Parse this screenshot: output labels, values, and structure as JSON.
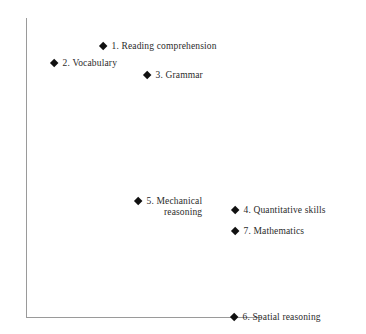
{
  "chart_data": {
    "type": "scatter",
    "title": "",
    "xlabel": "",
    "ylabel": "",
    "grid": false,
    "legend_position": "none",
    "axes": {
      "origin_px": [
        26,
        317
      ],
      "x_axis_end_px": [
        262,
        317
      ],
      "y_axis_top_px": [
        26,
        18
      ],
      "color": "#9a9a9a",
      "ticks": []
    },
    "marker": {
      "shape": "diamond",
      "color": "#111111",
      "size_px": 9
    },
    "points": [
      {
        "id": 1,
        "number": "1.",
        "label": "Reading comprehension",
        "x_px": 103,
        "y_px": 46
      },
      {
        "id": 2,
        "number": "2.",
        "label": "Vocabulary",
        "x_px": 54,
        "y_px": 63
      },
      {
        "id": 3,
        "number": "3.",
        "label": "Grammar",
        "x_px": 147,
        "y_px": 75
      },
      {
        "id": 5,
        "number": "5.",
        "label": "Mechanical",
        "label_line2": "reasoning",
        "x_px": 138,
        "y_px": 201
      },
      {
        "id": 4,
        "number": "4.",
        "label": "Quantitative skills",
        "x_px": 235,
        "y_px": 210
      },
      {
        "id": 7,
        "number": "7.",
        "label": "Mathematics",
        "x_px": 235,
        "y_px": 231
      },
      {
        "id": 6,
        "number": "6.",
        "label": "Spatial reasoning",
        "x_px": 234,
        "y_px": 317
      }
    ]
  }
}
